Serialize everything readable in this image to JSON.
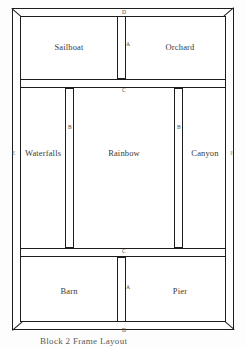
{
  "diagram": {
    "caption": "Block 2 Frame Layout",
    "ink_color": "#1d1d1d",
    "paper_color": "#ffffff",
    "regions": [
      {
        "id": "sailboat",
        "label": "Sailboat",
        "position": "top-left"
      },
      {
        "id": "orchard",
        "label": "Orchard",
        "position": "top-right"
      },
      {
        "id": "waterfalls",
        "label": "Waterfalls",
        "position": "middle-left"
      },
      {
        "id": "rainbow",
        "label": "Rainbow",
        "position": "middle-center"
      },
      {
        "id": "canyon",
        "label": "Canyon",
        "position": "middle-right"
      },
      {
        "id": "barn",
        "label": "Barn",
        "position": "bottom-left"
      },
      {
        "id": "pier",
        "label": "Pier",
        "position": "bottom-right"
      }
    ],
    "members": [
      {
        "id": "post-a-top",
        "letter": "A",
        "orientation": "vertical",
        "note": "divides Sailboat and Orchard"
      },
      {
        "id": "post-a-bottom",
        "letter": "A",
        "orientation": "vertical",
        "note": "divides Barn and Pier"
      },
      {
        "id": "post-b-left",
        "letter": "B",
        "orientation": "vertical",
        "note": "divides Waterfalls and Rainbow"
      },
      {
        "id": "post-b-right",
        "letter": "B",
        "orientation": "vertical",
        "note": "divides Rainbow and Canyon"
      },
      {
        "id": "band-h-top",
        "letter": "C",
        "orientation": "horizontal",
        "note": "between top row and middle row"
      },
      {
        "id": "band-h-bottom",
        "letter": "C",
        "orientation": "horizontal",
        "note": "between middle row and bottom row"
      },
      {
        "id": "edge-top",
        "letter": "D",
        "orientation": "horizontal",
        "note": "top outer rail"
      },
      {
        "id": "edge-bottom",
        "letter": "D",
        "orientation": "horizontal",
        "note": "bottom outer rail"
      },
      {
        "id": "edge-left",
        "letter": "E",
        "orientation": "vertical",
        "note": "left outer stile"
      },
      {
        "id": "edge-right",
        "letter": "E",
        "orientation": "vertical",
        "note": "right outer stile"
      }
    ]
  }
}
